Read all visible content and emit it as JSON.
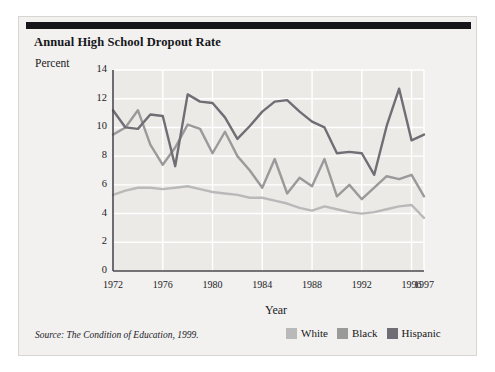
{
  "figure": {
    "title": "Annual High School Dropout Rate",
    "y_axis_caption": "Percent",
    "source_note": "Source: The Condition of Education, 1999.",
    "background_color": "#f2f1ef",
    "rule_color": "#15151a"
  },
  "legend": {
    "position": "bottom-right",
    "items": [
      {
        "label": "White",
        "color": "#b9b9b9"
      },
      {
        "label": "Black",
        "color": "#9a9a9a"
      },
      {
        "label": "Hispanic",
        "color": "#6e6e74"
      }
    ]
  },
  "chart_data": {
    "type": "line",
    "title": "Annual High School Dropout Rate",
    "subtitle": "",
    "xlabel": "Year",
    "ylabel": "Percent",
    "xlim": [
      1972,
      1997
    ],
    "ylim": [
      0,
      14
    ],
    "ytick_values": [
      0,
      2,
      4,
      6,
      8,
      10,
      12,
      14
    ],
    "ytick_labels": [
      "0",
      "2",
      "4",
      "6",
      "8",
      "10",
      "12",
      "14"
    ],
    "xtick_values": [
      1972,
      1976,
      1980,
      1984,
      1988,
      1992,
      1996,
      1997
    ],
    "xtick_labels": [
      "1972",
      "1976",
      "1980",
      "1984",
      "1988",
      "1992",
      "1996",
      "1997"
    ],
    "grid": true,
    "grid_color": "#ffffff",
    "x": [
      1972,
      1973,
      1974,
      1975,
      1976,
      1977,
      1978,
      1979,
      1980,
      1981,
      1982,
      1983,
      1984,
      1985,
      1986,
      1987,
      1988,
      1989,
      1990,
      1991,
      1992,
      1993,
      1994,
      1995,
      1996,
      1997
    ],
    "series": [
      {
        "name": "White",
        "color": "#b9b9b9",
        "values": [
          5.3,
          5.6,
          5.8,
          5.8,
          5.7,
          5.8,
          5.9,
          5.7,
          5.5,
          5.4,
          5.3,
          5.1,
          5.1,
          4.9,
          4.7,
          4.4,
          4.2,
          4.5,
          4.3,
          4.1,
          4.0,
          4.1,
          4.3,
          4.5,
          4.6,
          3.7
        ]
      },
      {
        "name": "Black",
        "color": "#9a9a9a",
        "values": [
          9.5,
          10.0,
          11.2,
          8.8,
          7.4,
          8.6,
          10.2,
          9.9,
          8.2,
          9.7,
          8.0,
          7.0,
          5.8,
          7.8,
          5.4,
          6.5,
          5.9,
          7.8,
          5.2,
          6.0,
          5.0,
          5.8,
          6.6,
          6.4,
          6.7,
          5.2
        ]
      },
      {
        "name": "Hispanic",
        "color": "#6e6e74",
        "values": [
          11.2,
          10.0,
          9.9,
          10.9,
          10.8,
          7.3,
          12.3,
          11.8,
          11.7,
          10.7,
          9.2,
          10.1,
          11.1,
          11.8,
          11.9,
          11.1,
          10.4,
          10.0,
          8.2,
          8.3,
          8.2,
          6.7,
          10.1,
          12.7,
          9.1,
          9.5
        ]
      }
    ]
  }
}
